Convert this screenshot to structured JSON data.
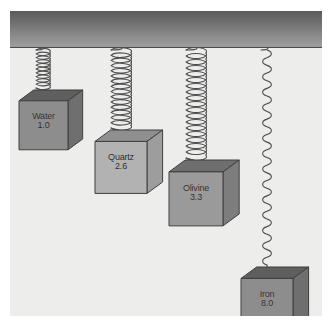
{
  "diagram": {
    "background_color": "#ededec",
    "ceiling_color_top": "#5a5a5a",
    "ceiling_color_bottom": "#9d9d9d",
    "units_note": "density (g/cm3)",
    "items": [
      {
        "id": "water",
        "name": "Water",
        "density": "1.0",
        "cube_fill": "#8d8d8d",
        "cube_top": "#5f5f5f",
        "cube_side": "#6f6f6f",
        "spring_style": "compressed",
        "spring_coils": 10,
        "spring_length_px": 38,
        "spring_width_px": 16,
        "x_px": 22,
        "cube_size_px": 49
      },
      {
        "id": "quartz",
        "name": "Quartz",
        "density": "2.6",
        "cube_fill": "#b2b2b2",
        "cube_top": "#8f8f8f",
        "cube_side": "#9d9d9d",
        "spring_style": "medium",
        "spring_coils": 15,
        "spring_length_px": 78,
        "spring_width_px": 22,
        "x_px": 97,
        "cube_size_px": 52
      },
      {
        "id": "olivine",
        "name": "Olivine",
        "density": "3.3",
        "cube_fill": "#9a9a9a",
        "cube_top": "#6e6e6e",
        "cube_side": "#7d7d7d",
        "spring_style": "long",
        "spring_coils": 18,
        "spring_length_px": 108,
        "spring_width_px": 22,
        "x_px": 172,
        "cube_size_px": 54
      },
      {
        "id": "iron",
        "name": "Iron",
        "density": "8.0",
        "cube_fill": "#8d8d8d",
        "cube_top": "#5f5f5f",
        "cube_side": "#6f6f6f",
        "spring_style": "stretched",
        "spring_coils": 14,
        "spring_length_px": 215,
        "spring_width_px": 14,
        "x_px": 247,
        "cube_size_px": 52
      }
    ]
  }
}
